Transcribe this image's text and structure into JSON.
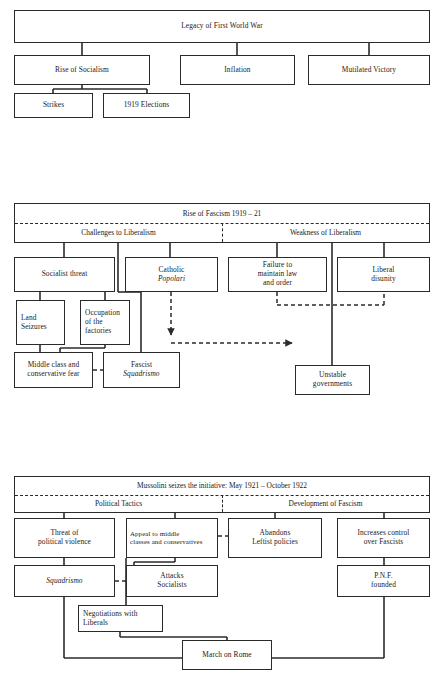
{
  "diagram": {
    "line_color": "#2b2b2b",
    "background": "#ffffff"
  },
  "section1": {
    "root": "Legacy of First World War",
    "level2": [
      "Rise of Socialism",
      "Inflation",
      "Mutilated Victory"
    ],
    "level3": [
      "Strikes",
      "1919 Elections"
    ]
  },
  "section2": {
    "banner": {
      "title": "Rise of Fascism 1919 – 21",
      "left_label": "Challenges to Liberalism",
      "right_label": "Weakness of  Liberalism"
    },
    "boxes": {
      "socialist_threat": "Socialist threat",
      "catholic_line1": "Catholic",
      "catholic_line2": "Popolari",
      "failure_line1": "Failure to",
      "failure_line2": "maintain law",
      "failure_line3": "and order",
      "liberal_line1": "Liberal",
      "liberal_line2": "disunity",
      "land_line1": "Land",
      "land_line2": "Seizures",
      "occupation_line1": "Occupation",
      "occupation_line2": "of the",
      "occupation_line3": "factories",
      "middle_line1": "Middle class and",
      "middle_line2": "conservative fear",
      "fascist_line1": "Fascist",
      "fascist_line2": "Squadrismo",
      "unstable_line1": "Unstable",
      "unstable_line2": "governments"
    }
  },
  "section3": {
    "banner": {
      "title": "Mussolini seizes the initiative: May 1921 – October 1922",
      "left_label": "Political Tactics",
      "right_label": "Development of Fascism"
    },
    "boxes": {
      "threat_line1": "Threat of",
      "threat_line2": "political violence",
      "appeal_line1": "Appeal to middle",
      "appeal_line2": "classes and conservatives",
      "abandons_line1": "Abandons",
      "abandons_line2": "Leftist policies",
      "increases_line1": "Increases control",
      "increases_line2": "over Fascists",
      "squadrismo": "Squadrismo",
      "attacks_line1": "Attacks",
      "attacks_line2": "Socialists",
      "pnf_line1": "P.N.F.",
      "pnf_line2": "founded",
      "negotiations_line1": "Negotiations with",
      "negotiations_line2": "Liberals",
      "march": "March on Rome"
    }
  }
}
